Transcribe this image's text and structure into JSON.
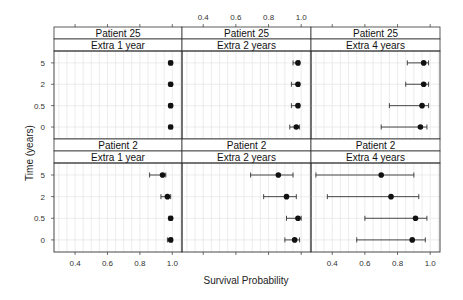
{
  "chart_data": {
    "type": "scatter",
    "subtype": "dot-plot-with-error-bars",
    "xlabel": "Survival Probability",
    "ylabel": "Time (years)",
    "x_ticks": [
      0.4,
      0.6,
      0.8,
      1.0
    ],
    "x_tick_labels": [
      "0.4",
      "0.6",
      "0.8",
      "1.0"
    ],
    "xlim": [
      0.27,
      1.06
    ],
    "y_categories": [
      "0",
      "0.5",
      "2",
      "5"
    ],
    "grid": true,
    "layout": {
      "rows": 2,
      "cols": 3
    },
    "panels": [
      {
        "row": 0,
        "col": 0,
        "strip_top": "Patient 25",
        "strip_bottom": "Extra 1 year",
        "points": [
          {
            "time": "5",
            "estimate": 0.99,
            "lower": 0.98,
            "upper": 1.0
          },
          {
            "time": "2",
            "estimate": 0.99,
            "lower": 0.98,
            "upper": 1.0
          },
          {
            "time": "0.5",
            "estimate": 0.99,
            "lower": 0.98,
            "upper": 1.0
          },
          {
            "time": "0",
            "estimate": 0.99,
            "lower": 0.98,
            "upper": 1.0
          }
        ]
      },
      {
        "row": 0,
        "col": 1,
        "strip_top": "Patient 25",
        "strip_bottom": "Extra 2 years",
        "points": [
          {
            "time": "5",
            "estimate": 0.98,
            "lower": 0.95,
            "upper": 0.99
          },
          {
            "time": "2",
            "estimate": 0.98,
            "lower": 0.94,
            "upper": 0.99
          },
          {
            "time": "0.5",
            "estimate": 0.98,
            "lower": 0.94,
            "upper": 0.99
          },
          {
            "time": "0",
            "estimate": 0.97,
            "lower": 0.93,
            "upper": 0.99
          }
        ]
      },
      {
        "row": 0,
        "col": 2,
        "strip_top": "Patient 25",
        "strip_bottom": "Extra 4 years",
        "points": [
          {
            "time": "5",
            "estimate": 0.96,
            "lower": 0.86,
            "upper": 0.99
          },
          {
            "time": "2",
            "estimate": 0.96,
            "lower": 0.85,
            "upper": 0.99
          },
          {
            "time": "0.5",
            "estimate": 0.95,
            "lower": 0.75,
            "upper": 0.99
          },
          {
            "time": "0",
            "estimate": 0.94,
            "lower": 0.7,
            "upper": 0.98
          }
        ]
      },
      {
        "row": 1,
        "col": 0,
        "strip_top": "Patient 2",
        "strip_bottom": "Extra 1 year",
        "points": [
          {
            "time": "5",
            "estimate": 0.94,
            "lower": 0.86,
            "upper": 0.96
          },
          {
            "time": "2",
            "estimate": 0.97,
            "lower": 0.93,
            "upper": 0.99
          },
          {
            "time": "0.5",
            "estimate": 0.99,
            "lower": 0.98,
            "upper": 1.0
          },
          {
            "time": "0",
            "estimate": 0.99,
            "lower": 0.97,
            "upper": 1.0
          }
        ]
      },
      {
        "row": 1,
        "col": 1,
        "strip_top": "Patient 2",
        "strip_bottom": "Extra 2 years",
        "points": [
          {
            "time": "5",
            "estimate": 0.86,
            "lower": 0.69,
            "upper": 0.95
          },
          {
            "time": "2",
            "estimate": 0.91,
            "lower": 0.77,
            "upper": 0.97
          },
          {
            "time": "0.5",
            "estimate": 0.98,
            "lower": 0.91,
            "upper": 1.0
          },
          {
            "time": "0",
            "estimate": 0.96,
            "lower": 0.9,
            "upper": 0.99
          }
        ]
      },
      {
        "row": 1,
        "col": 2,
        "strip_top": "Patient 2",
        "strip_bottom": "Extra 4 years",
        "points": [
          {
            "time": "5",
            "estimate": 0.7,
            "lower": 0.3,
            "upper": 0.9
          },
          {
            "time": "2",
            "estimate": 0.76,
            "lower": 0.37,
            "upper": 0.93
          },
          {
            "time": "0.5",
            "estimate": 0.91,
            "lower": 0.6,
            "upper": 0.98
          },
          {
            "time": "0",
            "estimate": 0.89,
            "lower": 0.55,
            "upper": 0.97
          }
        ]
      }
    ]
  },
  "colors": {
    "point": "#111111",
    "errorbar": "#333333",
    "grid": "#e4e4e4",
    "border": "#333333",
    "strip_bg": "#ffffff"
  }
}
